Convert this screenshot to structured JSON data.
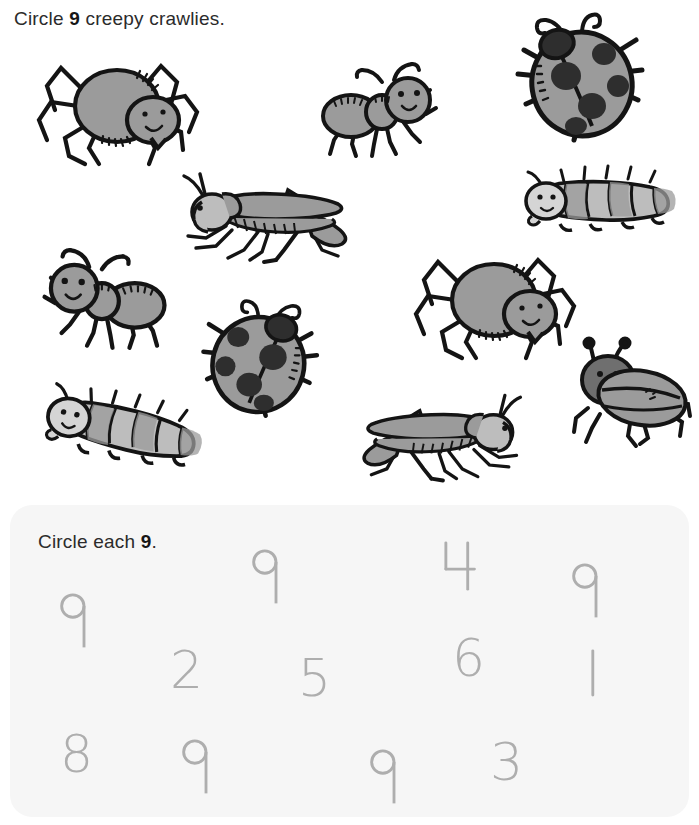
{
  "title": {
    "before": "Circle ",
    "target": "9",
    "after": " creepy crawlies."
  },
  "panel": {
    "title_before": "Circle each ",
    "title_target": "9",
    "title_after": "."
  },
  "colors": {
    "body_fill": "#9b9b9b",
    "body_fill_light": "#bdbdbd",
    "outline": "#141414",
    "spot": "#2e2e2e",
    "digit": "#aeaeae",
    "panel_background": "#f6f6f6",
    "text": "#2b2b2b"
  },
  "illustration": {
    "instruction_count": 9,
    "bugs": [
      {
        "name": "spider",
        "icon": "spider-icon",
        "x": 25,
        "y": 52,
        "w": 180,
        "h": 118,
        "flip": false,
        "rot": 0
      },
      {
        "name": "ant",
        "icon": "ant-icon",
        "x": 316,
        "y": 62,
        "w": 128,
        "h": 98,
        "flip": false,
        "rot": 0
      },
      {
        "name": "ladybug",
        "icon": "ladybug-icon",
        "x": 508,
        "y": 14,
        "w": 140,
        "h": 128,
        "flip": false,
        "rot": 0
      },
      {
        "name": "caterpillar",
        "icon": "caterpillar-icon",
        "x": 518,
        "y": 166,
        "w": 172,
        "h": 72,
        "flip": false,
        "rot": 0
      },
      {
        "name": "grasshopper",
        "icon": "grasshopper-icon",
        "x": 172,
        "y": 168,
        "w": 186,
        "h": 96,
        "flip": false,
        "rot": 0
      },
      {
        "name": "ant",
        "icon": "ant-icon",
        "x": 34,
        "y": 248,
        "w": 140,
        "h": 104,
        "flip": true,
        "rot": 0
      },
      {
        "name": "spider",
        "icon": "spider-icon",
        "x": 402,
        "y": 246,
        "w": 180,
        "h": 118,
        "flip": false,
        "rot": 0
      },
      {
        "name": "ladybug",
        "icon": "ladybug-icon",
        "x": 198,
        "y": 298,
        "w": 128,
        "h": 122,
        "flip": true,
        "rot": 0
      },
      {
        "name": "beetle",
        "icon": "beetle-icon",
        "x": 558,
        "y": 332,
        "w": 136,
        "h": 118,
        "flip": false,
        "rot": 0
      },
      {
        "name": "caterpillar",
        "icon": "caterpillar-icon",
        "x": 38,
        "y": 384,
        "w": 180,
        "h": 94,
        "flip": false,
        "rot": 12
      },
      {
        "name": "grasshopper",
        "icon": "grasshopper-icon",
        "x": 352,
        "y": 388,
        "w": 180,
        "h": 96,
        "flip": true,
        "rot": 0
      }
    ]
  },
  "digits": [
    {
      "value": "9",
      "x": 58,
      "y": 592,
      "size": 52
    },
    {
      "value": "9",
      "x": 250,
      "y": 548,
      "size": 52
    },
    {
      "value": "4",
      "x": 443,
      "y": 540,
      "size": 52
    },
    {
      "value": "9",
      "x": 570,
      "y": 562,
      "size": 52
    },
    {
      "value": "2",
      "x": 170,
      "y": 644,
      "size": 52
    },
    {
      "value": "5",
      "x": 298,
      "y": 652,
      "size": 52
    },
    {
      "value": "6",
      "x": 452,
      "y": 632,
      "size": 52
    },
    {
      "value": "1",
      "x": 585,
      "y": 648,
      "size": 52
    },
    {
      "value": "8",
      "x": 60,
      "y": 728,
      "size": 52
    },
    {
      "value": "9",
      "x": 180,
      "y": 738,
      "size": 52
    },
    {
      "value": "9",
      "x": 368,
      "y": 748,
      "size": 52
    },
    {
      "value": "3",
      "x": 490,
      "y": 736,
      "size": 52
    }
  ]
}
